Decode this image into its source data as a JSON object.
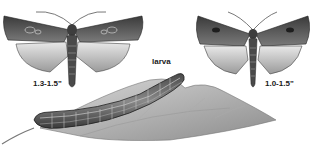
{
  "figure": {
    "subjects": [
      {
        "name": "adult-moth-left",
        "size_label": "1.3-1.5\""
      },
      {
        "name": "adult-moth-right",
        "size_label": "1.0-1.5\""
      },
      {
        "name": "larva",
        "label": "larva"
      }
    ],
    "colors": {
      "background": "#ffffff",
      "ink_dark": "#2a2a2a",
      "ink_mid": "#6e6e6e",
      "ink_light": "#bdbdbd"
    }
  }
}
